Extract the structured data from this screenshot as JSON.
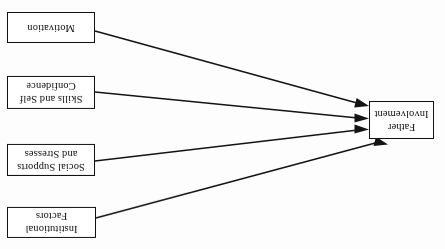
{
  "diagram": {
    "title": "Father Involvement",
    "orientation": "rotated-180",
    "background_color": "#fdfdfd",
    "line_color": "#141414",
    "box_border_color": "#111111",
    "box_fill_color": "#ffffff",
    "text_color": "#0d0d0d",
    "target_node": {
      "id": "father-involvement",
      "label": "Father Involvement",
      "line_1": "Father",
      "line_2": "Involvement"
    },
    "factor_nodes": [
      {
        "id": "institutional-factors",
        "label": "Institutional Factors",
        "line_1": "Institutional",
        "line_2": "Factors"
      },
      {
        "id": "social-supports-and-stresses",
        "label": "Social Supports and Stresses",
        "line_1": "Social Supports",
        "line_2": "and Stresses"
      },
      {
        "id": "skills-and-self-confidence",
        "label": "Skills and Self Confidence",
        "line_1": "Skills and Self",
        "line_2": "Confidence"
      },
      {
        "id": "motivation",
        "label": "Motivation",
        "line_1": "Motivation",
        "line_2": ""
      }
    ],
    "edges": [
      {
        "id": "edge-institutional-factors",
        "from": "institutional-factors",
        "to": "father-involvement",
        "arrow": "single"
      },
      {
        "id": "edge-social-supports-and-stresses",
        "from": "social-supports-and-stresses",
        "to": "father-involvement",
        "arrow": "single"
      },
      {
        "id": "edge-skills-and-self-confidence",
        "from": "skills-and-self-confidence",
        "to": "father-involvement",
        "arrow": "single"
      },
      {
        "id": "edge-motivation",
        "from": "motivation",
        "to": "father-involvement",
        "arrow": "single"
      }
    ]
  }
}
